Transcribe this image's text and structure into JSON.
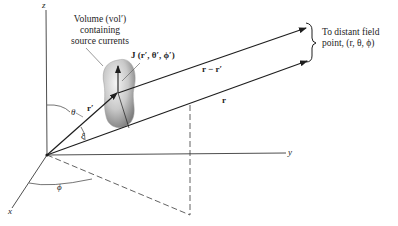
{
  "diagram": {
    "type": "3d-coordinate-geometry",
    "axes": {
      "z_label": "z",
      "y_label": "y",
      "x_label": "x"
    },
    "volume_label": {
      "line1": "Volume (vol′)",
      "line2": "containing",
      "line3": "source currents"
    },
    "current_label": "J (r′, θ′, ϕ′)",
    "vectors": {
      "r_prime": "r′",
      "r": "r",
      "r_minus_r_prime": "r − r′"
    },
    "angles": {
      "theta": "θ",
      "xi": "ξ",
      "phi": "ϕ"
    },
    "field_point_label": {
      "line1": "To distant field",
      "line2": "point, (r, θ, ϕ)"
    },
    "colors": {
      "ink": "#1e1e1e",
      "blob_light": "#eeeeee",
      "blob_dark": "#8a8a8a"
    }
  }
}
